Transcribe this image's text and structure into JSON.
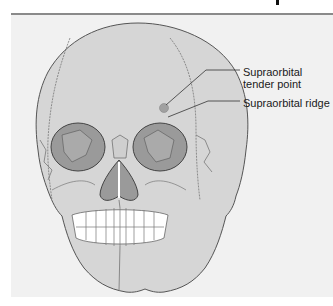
{
  "figure": {
    "labels": {
      "tender_point": "Supraorbital tender point",
      "ridge": "Supraorbital ridge"
    },
    "colors": {
      "background": "#f1f1f1",
      "bone": "#d6d6d6",
      "orbit": "#9a9a9a",
      "outline": "#555555",
      "teeth": "#ffffff",
      "tender_point": "#a0a0a0",
      "rule": "#8a8a8a"
    }
  }
}
